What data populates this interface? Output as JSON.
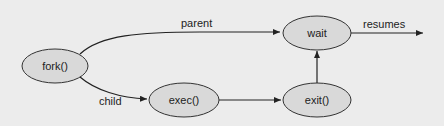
{
  "diagram": {
    "type": "process-flow",
    "colors": {
      "background": "#ececec",
      "node_fill": "#d9d9d9",
      "node_stroke": "#333333",
      "edge": "#222222",
      "text": "#222222"
    },
    "nodes": [
      {
        "id": "fork",
        "label": "fork()",
        "cx": 55,
        "cy": 66,
        "rx": 33,
        "ry": 17
      },
      {
        "id": "exec",
        "label": "exec()",
        "cx": 184,
        "cy": 100,
        "rx": 35,
        "ry": 17
      },
      {
        "id": "wait",
        "label": "wait",
        "cx": 317,
        "cy": 33,
        "rx": 34,
        "ry": 17
      },
      {
        "id": "exit",
        "label": "exit()",
        "cx": 317,
        "cy": 100,
        "rx": 34,
        "ry": 17
      }
    ],
    "edges": [
      {
        "from": "fork",
        "to": "wait",
        "label": "parent"
      },
      {
        "from": "fork",
        "to": "exec",
        "label": "child"
      },
      {
        "from": "exec",
        "to": "exit",
        "label": ""
      },
      {
        "from": "exit",
        "to": "wait",
        "label": ""
      },
      {
        "from": "wait",
        "to": "out",
        "label": "resumes"
      }
    ]
  },
  "labels": {
    "fork": "fork()",
    "exec": "exec()",
    "wait": "wait",
    "exit": "exit()",
    "parent": "parent",
    "child": "child",
    "resumes": "resumes"
  }
}
